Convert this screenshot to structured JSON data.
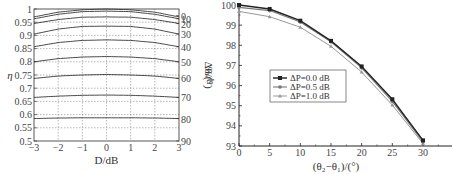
{
  "chart_data": [
    {
      "type": "line",
      "title": "",
      "xlabel": "D/dB",
      "ylabel": "η",
      "y2label": "Δθ/(°)",
      "xlim": [
        -3,
        3
      ],
      "ylim": [
        0.5,
        1
      ],
      "x_ticks": [
        "−3",
        "−2",
        "−1",
        "0",
        "1",
        "2",
        "3"
      ],
      "y_ticks": [
        "0.5",
        "0.55",
        "0.6",
        "0.65",
        "0.7",
        "0.75",
        "0.8",
        "0.85",
        "0.9",
        "0.95",
        "1"
      ],
      "y2_ticks": [
        "90",
        "80",
        "70",
        "60",
        "50",
        "40",
        "30",
        "20",
        "10",
        "0"
      ],
      "grid": "dotted",
      "x": [
        -3,
        -2,
        -1,
        0,
        1,
        2,
        3
      ],
      "series": [
        {
          "name": "Δθ=0",
          "values": [
            0.97,
            0.988,
            0.997,
            1.0,
            0.997,
            0.988,
            0.97
          ]
        },
        {
          "name": "Δθ=10",
          "values": [
            0.963,
            0.98,
            0.99,
            0.992,
            0.99,
            0.98,
            0.963
          ]
        },
        {
          "name": "Δθ=20",
          "values": [
            0.945,
            0.96,
            0.969,
            0.97,
            0.969,
            0.96,
            0.945
          ]
        },
        {
          "name": "Δθ=30",
          "values": [
            0.905,
            0.924,
            0.934,
            0.935,
            0.934,
            0.924,
            0.905
          ]
        },
        {
          "name": "Δθ=40",
          "values": [
            0.857,
            0.873,
            0.881,
            0.883,
            0.881,
            0.873,
            0.857
          ]
        },
        {
          "name": "Δθ=50",
          "values": [
            0.8,
            0.812,
            0.818,
            0.82,
            0.818,
            0.812,
            0.8
          ]
        },
        {
          "name": "Δθ=60",
          "values": [
            0.737,
            0.746,
            0.75,
            0.752,
            0.75,
            0.746,
            0.737
          ]
        },
        {
          "name": "Δθ=70",
          "values": [
            0.665,
            0.67,
            0.673,
            0.674,
            0.673,
            0.67,
            0.665
          ]
        },
        {
          "name": "Δθ=80",
          "values": [
            0.585,
            0.587,
            0.588,
            0.588,
            0.588,
            0.587,
            0.585
          ]
        }
      ]
    },
    {
      "type": "line",
      "title": "",
      "xlabel": "(θ2−θ1)/(°)",
      "ylabel": "η/%",
      "xlim": [
        0,
        32
      ],
      "ylim": [
        93,
        100
      ],
      "x_ticks": [
        "0",
        "5",
        "10",
        "15",
        "20",
        "25",
        "30"
      ],
      "y_ticks": [
        "93",
        "94",
        "95",
        "96",
        "97",
        "98",
        "99",
        "100"
      ],
      "grid": "off",
      "legend_position": "center-left",
      "x": [
        0,
        5,
        10,
        15,
        20,
        25,
        30
      ],
      "series": [
        {
          "name": "ΔP=0.0 dB",
          "marker": "square",
          "color": "#222222",
          "values": [
            100.0,
            99.8,
            99.22,
            98.22,
            96.95,
            95.32,
            93.28
          ]
        },
        {
          "name": "ΔP=0.5 dB",
          "marker": "circle",
          "color": "#777777",
          "values": [
            99.88,
            99.72,
            99.15,
            98.17,
            96.88,
            95.22,
            93.2
          ]
        },
        {
          "name": "ΔP=1.0 dB",
          "marker": "triangle",
          "color": "#999999",
          "values": [
            99.68,
            99.42,
            98.9,
            97.95,
            96.67,
            95.03,
            93.12
          ]
        }
      ]
    }
  ],
  "left": {
    "xlabel": "D/dB",
    "ylabel": "η",
    "y2label": "Δθ/(°)"
  },
  "right": {
    "xlabel": "(θ₂−θ₁)/(°)",
    "ylabel": "η/%",
    "legend": [
      "ΔP=0.0 dB",
      "ΔP=0.5 dB",
      "ΔP=1.0 dB"
    ]
  }
}
